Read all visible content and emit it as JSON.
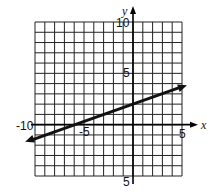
{
  "chart_data": {
    "type": "line",
    "title": "",
    "xlabel": "x",
    "ylabel": "y",
    "xlim": [
      -10,
      5
    ],
    "ylim": [
      -5,
      10
    ],
    "grid": true,
    "grid_step": 1,
    "tick_labels": {
      "x": [
        {
          "value": -10,
          "label": "-10"
        },
        {
          "value": -5,
          "label": "-5"
        },
        {
          "value": 5,
          "label": "5"
        }
      ],
      "y": [
        {
          "value": 10,
          "label": "10"
        },
        {
          "value": 5,
          "label": "5"
        },
        {
          "value": -5,
          "label": "5"
        }
      ]
    },
    "series": [
      {
        "name": "line",
        "equation": "y = x/3 + 2",
        "points": [
          [
            -11,
            -1.67
          ],
          [
            -6,
            0
          ],
          [
            0,
            2
          ],
          [
            5.5,
            3.83
          ]
        ],
        "arrows": "both",
        "color": "#111111"
      }
    ],
    "legend": null
  },
  "labels": {
    "x_axis": "x",
    "y_axis": "y",
    "x_neg10": "-10",
    "x_neg5": "-5",
    "x_5": "5",
    "y_10": "10",
    "y_5": "5",
    "y_neg5": "5"
  }
}
